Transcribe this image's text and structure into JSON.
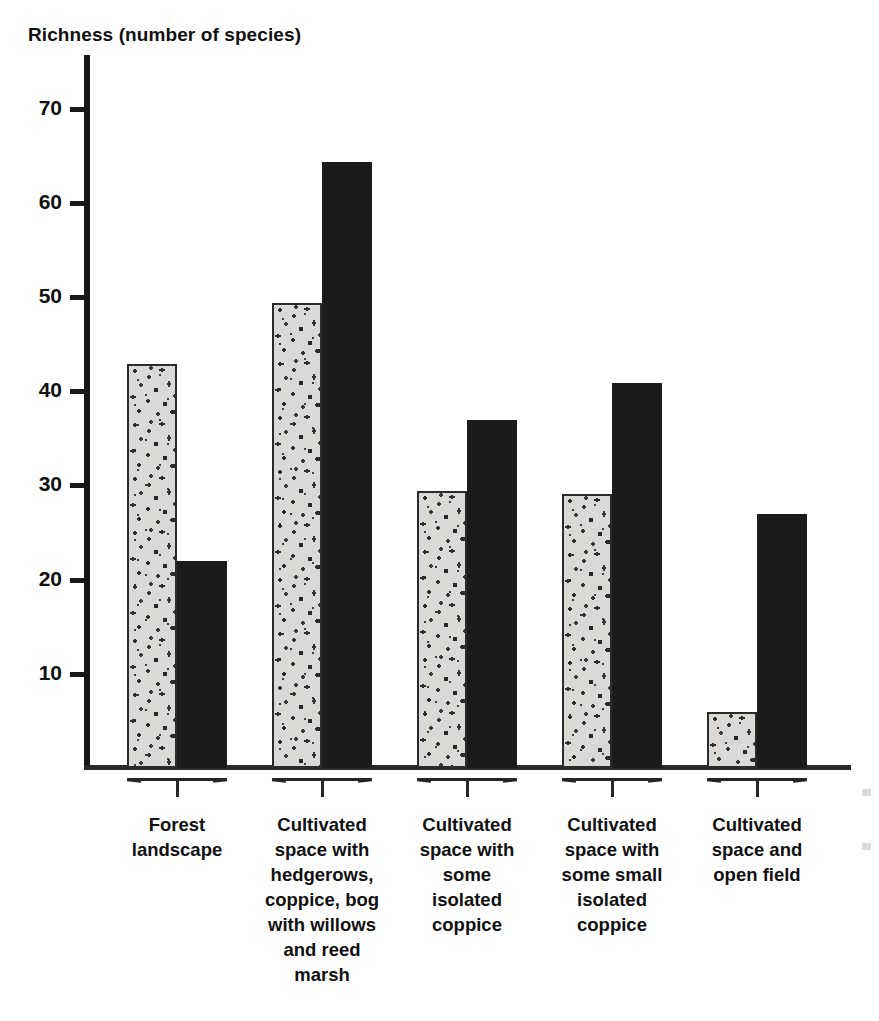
{
  "chart_data": {
    "type": "bar",
    "title": "Richness (number of species)",
    "xlabel": "",
    "ylabel": "Richness (number of species)",
    "ylim": [
      0,
      75
    ],
    "yticks": [
      10,
      20,
      30,
      40,
      50,
      60,
      70
    ],
    "grid": false,
    "legend": "none",
    "categories": [
      "Forest\nlandscape",
      "Cultivated\nspace with\nhedgerows,\ncoppice, bog\nwith willows\nand reed\nmarsh",
      "Cultivated\nspace with\nsome\nisolated\ncoppice",
      "Cultivated\nspace with\nsome small\nisolated\ncoppice",
      "Cultivated\nspace and\nopen field"
    ],
    "series": [
      {
        "name": "stippled",
        "fill": "stipple",
        "color": "#d6d5d1",
        "values": [
          43,
          49.5,
          29.5,
          29.2,
          6
        ]
      },
      {
        "name": "solid",
        "fill": "solid",
        "color": "#1b1b1b",
        "values": [
          22,
          64.5,
          37,
          41,
          27
        ]
      }
    ]
  },
  "axis": {
    "tick_labels": [
      "70",
      "60",
      "50",
      "40",
      "30",
      "20",
      "10"
    ]
  },
  "colors": {
    "axis": "#181818",
    "solid_bar": "#1b1b1b",
    "stipple_bg": "#d6d5d1",
    "text": "#111111",
    "background": "#ffffff"
  }
}
